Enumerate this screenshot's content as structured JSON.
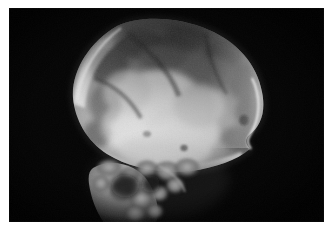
{
  "image": {
    "kind": "radiograph-photograph",
    "modality_label": "X-ray",
    "view_label": "lateral skull",
    "caption": "Lateral skull radiograph showing the calvarium and skull base",
    "border_color": "#ffffff",
    "film_background_color": "#050505",
    "bone_bright_color": "#f2f2f2",
    "bone_mid_color": "#9a9a9a",
    "bone_dark_color": "#3a3a3a",
    "plate": {
      "x": 9,
      "y": 8,
      "width": 315,
      "height": 214
    },
    "regions": [
      {
        "name": "calvarium",
        "label": "Calvarium",
        "brightness": "high"
      },
      {
        "name": "frontal-bone",
        "label": "Frontal bone",
        "brightness": "medium"
      },
      {
        "name": "occipital-bone",
        "label": "Occipital bone",
        "brightness": "medium"
      },
      {
        "name": "parietal-bone",
        "label": "Parietal bone",
        "brightness": "medium-dark"
      },
      {
        "name": "skull-base",
        "label": "Skull base",
        "brightness": "high"
      },
      {
        "name": "facial-bones",
        "label": "Facial bones",
        "brightness": "medium"
      },
      {
        "name": "cervical-spine",
        "label": "Cervical spine",
        "brightness": "medium-low"
      },
      {
        "name": "background-field",
        "label": "Exposed film background",
        "brightness": "black"
      }
    ]
  }
}
